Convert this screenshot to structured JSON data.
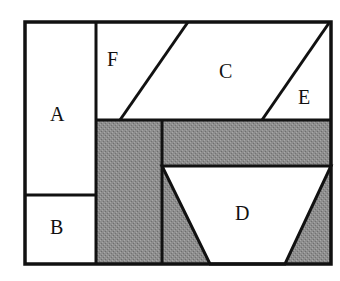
{
  "diagram": {
    "type": "region-partition",
    "colors": {
      "background": "#ffffff",
      "stroke": "#111111",
      "shaded": "#8c8c8c",
      "unshaded": "#ffffff"
    },
    "regions": [
      {
        "id": "A",
        "label": "A",
        "shaded": false
      },
      {
        "id": "B",
        "label": "B",
        "shaded": false
      },
      {
        "id": "C",
        "label": "C",
        "shaded": false
      },
      {
        "id": "D",
        "label": "D",
        "shaded": false
      },
      {
        "id": "E",
        "label": "E",
        "shaded": false
      },
      {
        "id": "F",
        "label": "F",
        "shaded": false
      }
    ],
    "shaded_regions": [
      "left-column-gray",
      "middle-band-gray",
      "bottom-left-triangle-gray",
      "bottom-right-triangle-gray"
    ]
  }
}
